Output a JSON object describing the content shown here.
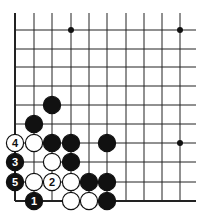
{
  "diagram": {
    "type": "go-board-corner",
    "corner": "bottom-left",
    "grid": {
      "columns_x": [
        15,
        34,
        52,
        71,
        89,
        107,
        126,
        144,
        162,
        180
      ],
      "rows_y": [
        30,
        49,
        67,
        86,
        105,
        124,
        143,
        162,
        182,
        201
      ],
      "open_top_y": 13,
      "open_right_x": 196,
      "line_color": "#222222",
      "edge_width": 2
    },
    "star_points": [
      {
        "col": 3,
        "row": 0
      },
      {
        "col": 9,
        "row": 0
      },
      {
        "col": 9,
        "row": 6
      }
    ],
    "stones": [
      {
        "color": "black",
        "col": 2,
        "row": 4,
        "label": ""
      },
      {
        "color": "black",
        "col": 1,
        "row": 5,
        "label": ""
      },
      {
        "color": "white",
        "col": 0,
        "row": 6,
        "label": "4"
      },
      {
        "color": "white",
        "col": 1,
        "row": 6,
        "label": ""
      },
      {
        "color": "black",
        "col": 2,
        "row": 6,
        "label": ""
      },
      {
        "color": "black",
        "col": 3,
        "row": 6,
        "label": ""
      },
      {
        "color": "black",
        "col": 5,
        "row": 6,
        "label": ""
      },
      {
        "color": "black",
        "col": 0,
        "row": 7,
        "label": "3"
      },
      {
        "color": "white",
        "col": 2,
        "row": 7,
        "label": ""
      },
      {
        "color": "black",
        "col": 3,
        "row": 7,
        "label": ""
      },
      {
        "color": "black",
        "col": 0,
        "row": 8,
        "label": "5"
      },
      {
        "color": "white",
        "col": 1,
        "row": 8,
        "label": ""
      },
      {
        "color": "white",
        "col": 2,
        "row": 8,
        "label": "2"
      },
      {
        "color": "white",
        "col": 3,
        "row": 8,
        "label": ""
      },
      {
        "color": "black",
        "col": 4,
        "row": 8,
        "label": ""
      },
      {
        "color": "black",
        "col": 5,
        "row": 8,
        "label": ""
      },
      {
        "color": "black",
        "col": 1,
        "row": 9,
        "label": "1"
      },
      {
        "color": "white",
        "col": 3,
        "row": 9,
        "label": ""
      },
      {
        "color": "white",
        "col": 4,
        "row": 9,
        "label": ""
      },
      {
        "color": "black",
        "col": 5,
        "row": 9,
        "label": ""
      }
    ],
    "stone_radius": 8.6,
    "colors": {
      "black": "#111111",
      "white": "#ffffff",
      "stroke": "#111111"
    }
  }
}
